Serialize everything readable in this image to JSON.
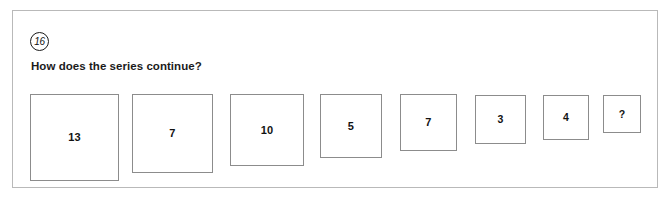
{
  "card": {
    "question_number": "16",
    "prompt": "How does the series continue?"
  },
  "series": {
    "items": [
      {
        "value": "13",
        "left": 17,
        "top": 83,
        "width": 89,
        "height": 87,
        "font_size": 11
      },
      {
        "value": "7",
        "left": 119,
        "top": 83,
        "width": 81,
        "height": 79,
        "font_size": 11
      },
      {
        "value": "10",
        "left": 217,
        "top": 83,
        "width": 74,
        "height": 72,
        "font_size": 11
      },
      {
        "value": "5",
        "left": 307,
        "top": 83,
        "width": 62,
        "height": 64,
        "font_size": 11
      },
      {
        "value": "7",
        "left": 387,
        "top": 83,
        "width": 57,
        "height": 57,
        "font_size": 11
      },
      {
        "value": "3",
        "left": 462,
        "top": 84,
        "width": 51,
        "height": 49,
        "font_size": 10.5
      },
      {
        "value": "4",
        "left": 530,
        "top": 84,
        "width": 46,
        "height": 45,
        "font_size": 10.5
      },
      {
        "value": "?",
        "left": 590,
        "top": 84,
        "width": 38,
        "height": 38,
        "font_size": 10.5
      }
    ]
  }
}
